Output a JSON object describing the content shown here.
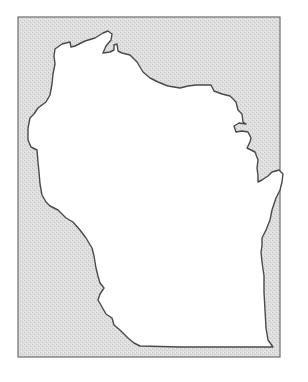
{
  "map": {
    "subject": "Wisconsin state outline",
    "colors": {
      "page_background": "#ffffff",
      "frame_fill": "#dcdcdc",
      "frame_stroke": "#6e6e6e",
      "state_fill": "#ffffff",
      "state_stroke": "#4a4a4a"
    },
    "frame": {
      "x": 18,
      "y": 17,
      "width": 262,
      "height": 340
    }
  }
}
